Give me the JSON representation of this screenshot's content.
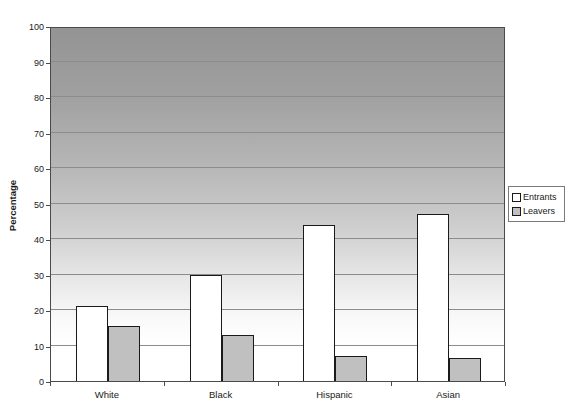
{
  "chart_data": {
    "type": "bar",
    "title": "",
    "xlabel": "",
    "ylabel": "Percentage",
    "categories": [
      "White",
      "Black",
      "Hispanic",
      "Asian"
    ],
    "series": [
      {
        "name": "Entrants",
        "fill": "#FFFFFF",
        "values": [
          21,
          30,
          44,
          47
        ]
      },
      {
        "name": "Leavers",
        "fill": "#C0C0C0",
        "values": [
          15.5,
          13,
          7,
          6.5
        ]
      }
    ],
    "ylim": [
      0,
      100
    ],
    "ytick_interval": 10,
    "yticks": [
      0,
      10,
      20,
      30,
      40,
      50,
      60,
      70,
      80,
      90,
      100
    ],
    "grid": true,
    "gridline_color": "#8C8C8C",
    "plot_background_gradient": {
      "top": "#949494",
      "bottom": "#FFFFFF"
    },
    "bar_border_color": "#1A1A1A",
    "legend_position": "right-outside"
  }
}
